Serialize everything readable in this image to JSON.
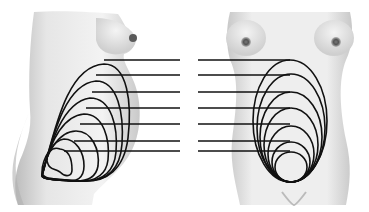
{
  "diagram": {
    "views": [
      {
        "name": "side-view",
        "label": ""
      },
      {
        "name": "front-view",
        "label": ""
      }
    ],
    "stage_count": 7,
    "level_lines_y": [
      60,
      75,
      92,
      108,
      124,
      141,
      151
    ],
    "colors": {
      "outline": "#111111",
      "skin_light": "#f2f2f2",
      "skin_mid": "#d9d9d9",
      "skin_shadow": "#b5b5b5",
      "background": "#ffffff"
    }
  }
}
